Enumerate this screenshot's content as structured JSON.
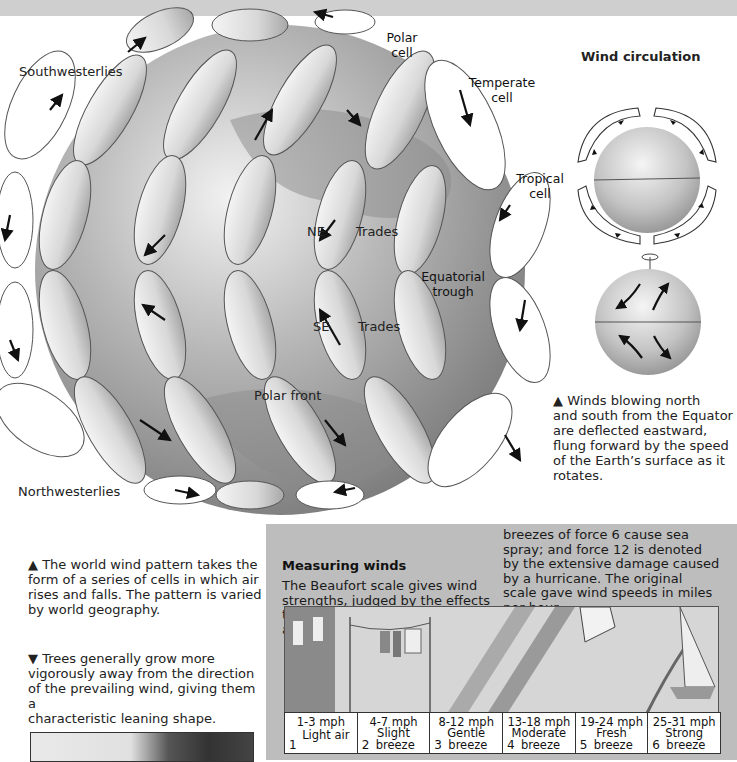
{
  "globe": {
    "labels": {
      "polar_cell": [
        "Polar",
        "cell"
      ],
      "temperate_cell": [
        "Temperate",
        "cell"
      ],
      "tropical_cell": [
        "Tropical",
        "cell"
      ],
      "southwesterlies": "Southwesterlies",
      "northwesterlies": "Northwesterlies",
      "ne": "NE",
      "ne_trades": "Trades",
      "equatorial_trough": [
        "Equatorial",
        "trough"
      ],
      "se": "SE",
      "se_trades": "Trades",
      "polar_front": "Polar front"
    }
  },
  "wind_circulation": {
    "title": "Wind circulation",
    "caption": [
      "▲ Winds blowing north",
      "and south from the Equator",
      "are deflected eastward,",
      "flung forward by the speed",
      "of the Earth’s surface as it",
      "rotates."
    ]
  },
  "left_captions": {
    "world_wind": [
      "▲ The world wind pattern takes the",
      "form of a series of cells in which air",
      "rises and falls. The pattern is varied",
      "by world geography."
    ],
    "trees": [
      "▼ Trees generally grow more",
      "vigorously away from the direction",
      "of the prevailing wind, giving them a",
      "characteristic leaning shape."
    ]
  },
  "measuring_winds": {
    "title": "Measuring winds",
    "col1": [
      "The Beaufort scale gives wind",
      "strengths, judged by the effects",
      "they produce. Force 1 shows no",
      "air movement at all; the strong"
    ],
    "col2": [
      "breezes of force 6 cause sea",
      "spray; and force 12 is denoted",
      "by the extensive damage caused",
      "by a hurricane. The original",
      "scale gave wind speeds in miles",
      "per hour."
    ],
    "scale": [
      {
        "force": "1",
        "mph": "1-3 mph",
        "name": "Light air",
        "name2": ""
      },
      {
        "force": "2",
        "mph": "4-7 mph",
        "name": "Slight",
        "name2": "breeze"
      },
      {
        "force": "3",
        "mph": "8-12 mph",
        "name": "Gentle",
        "name2": "breeze"
      },
      {
        "force": "4",
        "mph": "13-18 mph",
        "name": "Moderate",
        "name2": "breeze"
      },
      {
        "force": "5",
        "mph": "19-24 mph",
        "name": "Fresh",
        "name2": "breeze"
      },
      {
        "force": "6",
        "mph": "25-31 mph",
        "name": "Strong",
        "name2": "breeze"
      }
    ]
  },
  "colors": {
    "top_bar": "#cfcfcf",
    "panel_bg": "#bdbdbd",
    "globe": "#9a9a9a",
    "ribbon": "#e4e4e4"
  }
}
